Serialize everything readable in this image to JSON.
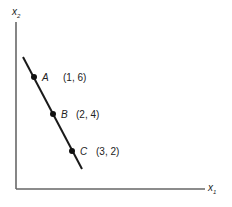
{
  "diagram": {
    "axes": {
      "x_label": "x",
      "x_sub": "1",
      "y_label": "x",
      "y_sub": "2"
    },
    "points": [
      {
        "name": "A",
        "coords": "(1, 6)"
      },
      {
        "name": "B",
        "coords": "(2, 4)"
      },
      {
        "name": "C",
        "coords": "(3, 2)"
      }
    ],
    "colors": {
      "ink": "#1a1a1a",
      "axis": "#555555"
    }
  }
}
